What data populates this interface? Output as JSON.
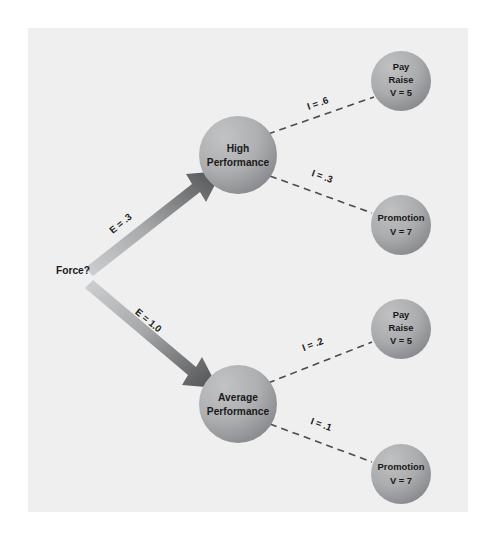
{
  "figure": {
    "background_color": "#ffffff",
    "panel_color": "#efeff0",
    "corner_watermark": "",
    "node_fill_light": "#b6b7b8",
    "node_fill_dark": "#8d8f91",
    "arrow_light": "#c9cacb",
    "arrow_dark": "#58595b",
    "dash_color": "#4a4b4d",
    "text_color": "#1a1a1a"
  },
  "root": {
    "label": "Force?"
  },
  "expectancy_edges": [
    {
      "id": "e-high",
      "label": "E = .3",
      "target": "High Performance"
    },
    {
      "id": "e-average",
      "label": "E = 1.0",
      "target": "Average Performance"
    }
  ],
  "performance_nodes": [
    {
      "id": "high-performance",
      "line1": "High",
      "line2": "Performance"
    },
    {
      "id": "average-performance",
      "line1": "Average",
      "line2": "Performance"
    }
  ],
  "outcome_nodes": [
    {
      "id": "pay-raise-top",
      "line1": "Pay",
      "line2": "Raise",
      "line3": "V = 5"
    },
    {
      "id": "promotion-top",
      "line1": "Promotion",
      "line2": "V = 7",
      "line3": ""
    },
    {
      "id": "pay-raise-bottom",
      "line1": "Pay",
      "line2": "Raise",
      "line3": "V = 5"
    },
    {
      "id": "promotion-bottom",
      "line1": "Promotion",
      "line2": "V = 7",
      "line3": ""
    }
  ],
  "instrumentality_edges": [
    {
      "id": "i-high-pay",
      "label": "I = .6",
      "from": "High Performance",
      "to": "Pay Raise"
    },
    {
      "id": "i-high-promo",
      "label": "I = .3",
      "from": "High Performance",
      "to": "Promotion"
    },
    {
      "id": "i-avg-pay",
      "label": "I = .2",
      "from": "Average Performance",
      "to": "Pay Raise"
    },
    {
      "id": "i-avg-promo",
      "label": "I = .1",
      "from": "Average Performance",
      "to": "Promotion"
    }
  ]
}
